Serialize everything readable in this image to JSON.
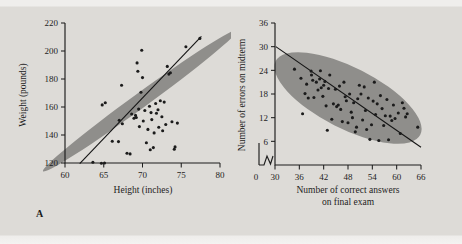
{
  "figure": {
    "background_color": "#dddbd7",
    "ellipse_color": "#8f8e8b",
    "ink_color": "#1d1d1d"
  },
  "panels": [
    {
      "tag": "A"
    },
    {
      "tag": "B"
    }
  ],
  "chart_data": [
    {
      "type": "scatter",
      "panel": "A",
      "title": "",
      "xlabel": "Height (inches)",
      "ylabel": "Weight (pounds)",
      "xlim": [
        60,
        80
      ],
      "ylim": [
        120,
        220
      ],
      "xticks": [
        60,
        65,
        70,
        75,
        80
      ],
      "yticks": [
        120,
        140,
        160,
        180,
        200,
        220
      ],
      "xtick_labels": [
        "60",
        "65",
        "70",
        "75",
        "80"
      ],
      "ytick_labels": [
        "120",
        "140",
        "160",
        "180",
        "200",
        "220"
      ],
      "grid": false,
      "legend": null,
      "axis_break": false,
      "annotations": [
        "A"
      ],
      "trendline": {
        "x": [
          61.9,
          77.6
        ],
        "y": [
          119.5,
          210.5
        ],
        "direction": "positive"
      },
      "confidence_ellipse": {
        "center_x": 69.7,
        "center_y": 164.5,
        "width": 31.0,
        "height": 10.6,
        "angle_deg": -36
      },
      "points": [
        {
          "x": 63.6,
          "y": 120.5
        },
        {
          "x": 64.7,
          "y": 119.8
        },
        {
          "x": 65.1,
          "y": 120.0
        },
        {
          "x": 64.8,
          "y": 161.5
        },
        {
          "x": 65.2,
          "y": 163.0
        },
        {
          "x": 66.1,
          "y": 135.5
        },
        {
          "x": 66.9,
          "y": 135.3
        },
        {
          "x": 67.0,
          "y": 150.5
        },
        {
          "x": 67.3,
          "y": 175.5
        },
        {
          "x": 67.4,
          "y": 148.0
        },
        {
          "x": 68.0,
          "y": 127.0
        },
        {
          "x": 68.4,
          "y": 126.5
        },
        {
          "x": 68.6,
          "y": 155.0
        },
        {
          "x": 68.9,
          "y": 152.0
        },
        {
          "x": 69.1,
          "y": 154.0
        },
        {
          "x": 69.2,
          "y": 152.5
        },
        {
          "x": 69.3,
          "y": 191.5
        },
        {
          "x": 69.4,
          "y": 185.5
        },
        {
          "x": 69.5,
          "y": 158.5
        },
        {
          "x": 69.6,
          "y": 146.0
        },
        {
          "x": 69.8,
          "y": 170.5
        },
        {
          "x": 69.9,
          "y": 200.5
        },
        {
          "x": 70.0,
          "y": 181.0
        },
        {
          "x": 70.1,
          "y": 150.0
        },
        {
          "x": 70.3,
          "y": 157.5
        },
        {
          "x": 70.5,
          "y": 134.5
        },
        {
          "x": 70.7,
          "y": 144.0
        },
        {
          "x": 70.9,
          "y": 160.5
        },
        {
          "x": 71.0,
          "y": 129.5
        },
        {
          "x": 71.1,
          "y": 156.0
        },
        {
          "x": 71.2,
          "y": 151.0
        },
        {
          "x": 71.4,
          "y": 131.0
        },
        {
          "x": 71.5,
          "y": 141.5
        },
        {
          "x": 71.7,
          "y": 162.5
        },
        {
          "x": 71.8,
          "y": 155.5
        },
        {
          "x": 72.0,
          "y": 158.0
        },
        {
          "x": 72.1,
          "y": 145.5
        },
        {
          "x": 72.3,
          "y": 164.5
        },
        {
          "x": 72.5,
          "y": 153.0
        },
        {
          "x": 72.6,
          "y": 143.0
        },
        {
          "x": 72.8,
          "y": 163.5
        },
        {
          "x": 73.0,
          "y": 147.5
        },
        {
          "x": 73.2,
          "y": 189.0
        },
        {
          "x": 73.4,
          "y": 183.5
        },
        {
          "x": 73.6,
          "y": 184.5
        },
        {
          "x": 73.8,
          "y": 149.5
        },
        {
          "x": 74.1,
          "y": 129.8
        },
        {
          "x": 74.2,
          "y": 131.5
        },
        {
          "x": 74.5,
          "y": 148.5
        },
        {
          "x": 75.6,
          "y": 203.0
        },
        {
          "x": 77.4,
          "y": 209.0
        }
      ]
    },
    {
      "type": "scatter",
      "panel": "B",
      "title": "",
      "xlabel": "Number of correct answers on final exam",
      "xlabel_line1": "Number of correct answers",
      "xlabel_line2": "on final exam",
      "ylabel": "Number of errors on midterm",
      "xlim": [
        30,
        66
      ],
      "ylim": [
        0,
        36
      ],
      "xticks": [
        30,
        36,
        42,
        48,
        54,
        60,
        66
      ],
      "yticks": [
        6,
        12,
        18,
        24,
        30,
        36
      ],
      "xtick_labels": [
        "30",
        "36",
        "42",
        "48",
        "54",
        "60",
        "66"
      ],
      "ytick_labels": [
        "6",
        "12",
        "18",
        "24",
        "30",
        "36"
      ],
      "origin_label": "0",
      "grid": false,
      "legend": null,
      "axis_break": true,
      "annotations": [
        "B"
      ],
      "trendline": {
        "x": [
          30.2,
          66.0
        ],
        "y": [
          30.0,
          4.5
        ],
        "direction": "negative"
      },
      "confidence_ellipse": {
        "center_x": 48.0,
        "center_y": 17.0,
        "width": 40.0,
        "height": 15.5,
        "angle_deg": 27
      },
      "points": [
        {
          "x": 34.8,
          "y": 24.3
        },
        {
          "x": 36.4,
          "y": 22.0
        },
        {
          "x": 36.8,
          "y": 13.0
        },
        {
          "x": 37.4,
          "y": 18.1
        },
        {
          "x": 37.8,
          "y": 20.5
        },
        {
          "x": 38.2,
          "y": 17.0
        },
        {
          "x": 38.9,
          "y": 23.8
        },
        {
          "x": 39.0,
          "y": 22.8
        },
        {
          "x": 39.3,
          "y": 21.5
        },
        {
          "x": 39.6,
          "y": 17.1
        },
        {
          "x": 40.2,
          "y": 21.0
        },
        {
          "x": 40.6,
          "y": 19.0
        },
        {
          "x": 41.0,
          "y": 21.8
        },
        {
          "x": 41.2,
          "y": 23.9
        },
        {
          "x": 41.4,
          "y": 19.6
        },
        {
          "x": 41.8,
          "y": 17.4
        },
        {
          "x": 42.0,
          "y": 20.2
        },
        {
          "x": 42.3,
          "y": 21.2
        },
        {
          "x": 42.6,
          "y": 15.0
        },
        {
          "x": 42.9,
          "y": 8.8
        },
        {
          "x": 43.2,
          "y": 19.4
        },
        {
          "x": 43.5,
          "y": 22.8
        },
        {
          "x": 44.0,
          "y": 11.6
        },
        {
          "x": 44.4,
          "y": 15.5
        },
        {
          "x": 44.9,
          "y": 19.2
        },
        {
          "x": 45.2,
          "y": 14.8
        },
        {
          "x": 45.6,
          "y": 15.2
        },
        {
          "x": 45.9,
          "y": 20.0
        },
        {
          "x": 46.2,
          "y": 14.1
        },
        {
          "x": 46.6,
          "y": 11.0
        },
        {
          "x": 47.0,
          "y": 21.0
        },
        {
          "x": 47.3,
          "y": 17.3
        },
        {
          "x": 47.6,
          "y": 16.3
        },
        {
          "x": 48.0,
          "y": 10.7
        },
        {
          "x": 48.4,
          "y": 18.0
        },
        {
          "x": 48.8,
          "y": 13.4
        },
        {
          "x": 49.1,
          "y": 12.0
        },
        {
          "x": 49.4,
          "y": 15.8
        },
        {
          "x": 49.8,
          "y": 8.4
        },
        {
          "x": 50.1,
          "y": 9.6
        },
        {
          "x": 50.4,
          "y": 16.8
        },
        {
          "x": 50.8,
          "y": 20.2
        },
        {
          "x": 51.2,
          "y": 18.0
        },
        {
          "x": 51.6,
          "y": 11.4
        },
        {
          "x": 52.0,
          "y": 19.8
        },
        {
          "x": 52.3,
          "y": 13.8
        },
        {
          "x": 52.6,
          "y": 9.0
        },
        {
          "x": 53.0,
          "y": 17.0
        },
        {
          "x": 53.4,
          "y": 6.5
        },
        {
          "x": 53.8,
          "y": 10.2
        },
        {
          "x": 54.2,
          "y": 16.2
        },
        {
          "x": 54.5,
          "y": 21.0
        },
        {
          "x": 54.8,
          "y": 12.8
        },
        {
          "x": 55.2,
          "y": 15.5
        },
        {
          "x": 55.6,
          "y": 6.2
        },
        {
          "x": 56.0,
          "y": 17.6
        },
        {
          "x": 56.4,
          "y": 14.3
        },
        {
          "x": 56.8,
          "y": 10.0
        },
        {
          "x": 57.2,
          "y": 12.5
        },
        {
          "x": 57.6,
          "y": 16.6
        },
        {
          "x": 58.0,
          "y": 6.4
        },
        {
          "x": 58.4,
          "y": 12.4
        },
        {
          "x": 58.8,
          "y": 11.3
        },
        {
          "x": 59.2,
          "y": 15.2
        },
        {
          "x": 59.6,
          "y": 11.8
        },
        {
          "x": 60.4,
          "y": 13.2
        },
        {
          "x": 60.9,
          "y": 8.0
        },
        {
          "x": 61.4,
          "y": 15.8
        },
        {
          "x": 61.8,
          "y": 14.4
        },
        {
          "x": 62.2,
          "y": 12.2
        },
        {
          "x": 62.6,
          "y": 13.0
        },
        {
          "x": 65.2,
          "y": 9.6
        }
      ]
    }
  ]
}
